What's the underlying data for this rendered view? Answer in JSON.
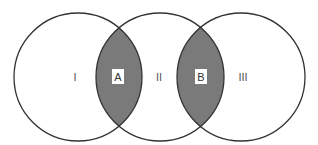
{
  "diagram": {
    "type": "three-circle venn (chain)",
    "colors": {
      "background": "#ffffff",
      "stroke": "#333333",
      "overlap_fill": "#7a7a7a",
      "label_box": "#ffffff"
    },
    "circles": [
      {
        "id": "left",
        "cx": 78,
        "cy": 77,
        "r": 64,
        "label": "I"
      },
      {
        "id": "middle",
        "cx": 160,
        "cy": 77,
        "r": 64,
        "label": "II"
      },
      {
        "id": "right",
        "cx": 241,
        "cy": 77,
        "r": 64,
        "label": "III"
      }
    ],
    "overlaps": [
      {
        "id": "A",
        "between": [
          "left",
          "middle"
        ],
        "label": "A"
      },
      {
        "id": "B",
        "between": [
          "middle",
          "right"
        ],
        "label": "B"
      }
    ]
  }
}
